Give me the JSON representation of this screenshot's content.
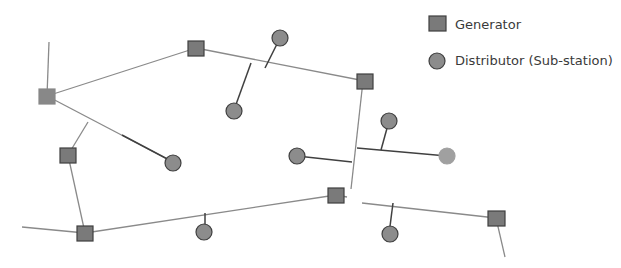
{
  "diagram": {
    "type": "power-grid-network",
    "legend": [
      {
        "shape": "square",
        "label": "Generator"
      },
      {
        "shape": "circle",
        "label": "Distributor (Sub-station)"
      }
    ],
    "colors": {
      "node_fill": "#7f7f7f",
      "node_stroke": "#3f3f3f",
      "distributor_fill": "#8c8c8c",
      "highlight_distributor_fill": "#a6a6a6",
      "line": "#808080",
      "branch_line": "#404040"
    },
    "generators": [
      "G1",
      "G2",
      "G3",
      "G4",
      "G5",
      "G6",
      "G7"
    ],
    "distributors": [
      "D1",
      "D2",
      "D3",
      "D4",
      "D5",
      "D6",
      "D7",
      "D8",
      "D9"
    ]
  }
}
